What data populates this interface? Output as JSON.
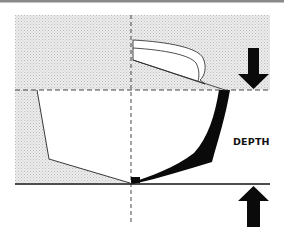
{
  "diagram": {
    "labels": {
      "depth": "DEPTH"
    },
    "elements": {
      "waterline": "dashed horizontal reference line at deck/sheer level",
      "centerline": "dashed vertical centerline",
      "baseline": "solid horizontal line at keel bottom",
      "arrow_down": "arrow pointing down to upper reference line",
      "arrow_up": "arrow pointing up to baseline"
    },
    "colors": {
      "stipple": "#d9d9d9",
      "ink": "#111111",
      "top_rule": "#888888",
      "background": "#ffffff"
    }
  }
}
